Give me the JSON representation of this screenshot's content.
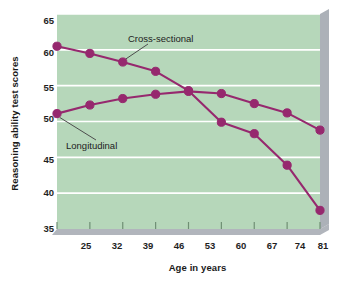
{
  "chart_data": {
    "type": "line",
    "title": "",
    "subtitle": "",
    "xlabel": "Age in years",
    "ylabel": "Reasoning ability test scores",
    "x": [
      25,
      32,
      39,
      46,
      53,
      60,
      67,
      74,
      81
    ],
    "categories": [
      "25",
      "32",
      "39",
      "46",
      "53",
      "60",
      "67",
      "74",
      "81"
    ],
    "xticklabels": [
      "25",
      "32",
      "39",
      "46",
      "53",
      "60",
      "67",
      "74",
      "81"
    ],
    "yticklabels": [
      "35",
      "40",
      "45",
      "50",
      "55",
      "60",
      "65"
    ],
    "yticks": [
      35,
      40,
      45,
      50,
      55,
      60,
      65
    ],
    "xlim": [
      25,
      81
    ],
    "ylim": [
      35,
      65
    ],
    "grid": "horizontal",
    "legend_position": "inline-annotations",
    "series": [
      {
        "name": "Cross-sectional",
        "values": [
          60.5,
          59.5,
          58.3,
          57.0,
          54.3,
          49.9,
          48.3,
          43.9,
          37.6
        ],
        "color": "#96286e",
        "marker": "circle"
      },
      {
        "name": "Longitudinal",
        "values": [
          51.1,
          52.3,
          53.2,
          53.8,
          54.2,
          53.9,
          52.5,
          51.2,
          48.8
        ],
        "color": "#96286e",
        "marker": "circle"
      }
    ],
    "annotations": [
      {
        "text": "Cross-sectional",
        "target_x": 39,
        "target_y": 58.3
      },
      {
        "text": "Longitudinal",
        "target_x": 25,
        "target_y": 51.1
      }
    ],
    "colors": {
      "plot_background": "#b6d7ba",
      "gridline": "#ffffff",
      "line": "#96286e",
      "marker": "#96286e",
      "shadow": "#9ea3ab",
      "page_background": "#ffffff",
      "text": "#1a1a1a"
    }
  }
}
